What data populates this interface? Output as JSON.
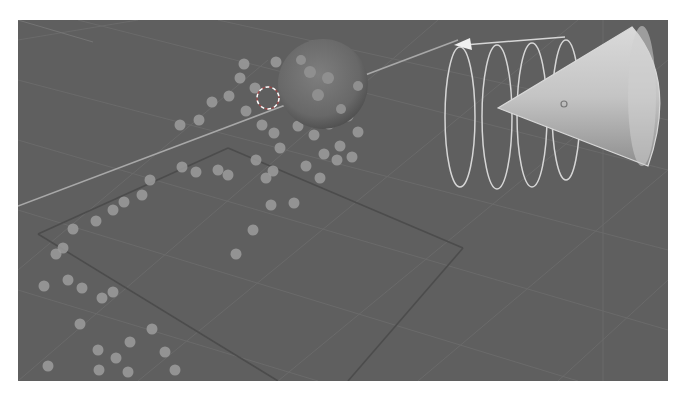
{
  "viewport": {
    "kind": "3d-viewport",
    "background_color": "#5f5f5f",
    "grid_color": "#6c6c6c",
    "axis_line_color": "#a9a9a9",
    "particle_color": "#9c9c9c",
    "objects": [
      {
        "name": "emitter-sphere",
        "type": "uv-sphere",
        "color": "#6a6a6a"
      },
      {
        "name": "cone",
        "type": "cone",
        "color": "#c8c8c8"
      },
      {
        "name": "vortex-spiral",
        "type": "force-field-vortex",
        "color": "#d8d8d8"
      },
      {
        "name": "3d-cursor",
        "type": "cursor"
      },
      {
        "name": "ground-plane",
        "type": "plane-outline",
        "color": "#4e4e4e"
      }
    ],
    "particles": [
      [
        226,
        44
      ],
      [
        295,
        26
      ],
      [
        258,
        42
      ],
      [
        330,
        48
      ],
      [
        305,
        70
      ],
      [
        284,
        62
      ],
      [
        270,
        66
      ],
      [
        222,
        58
      ],
      [
        237,
        68
      ],
      [
        211,
        76
      ],
      [
        194,
        82
      ],
      [
        181,
        100
      ],
      [
        162,
        105
      ],
      [
        228,
        91
      ],
      [
        244,
        105
      ],
      [
        256,
        113
      ],
      [
        278,
        83
      ],
      [
        280,
        106
      ],
      [
        296,
        115
      ],
      [
        311,
        104
      ],
      [
        330,
        96
      ],
      [
        340,
        112
      ],
      [
        322,
        126
      ],
      [
        306,
        134
      ],
      [
        288,
        146
      ],
      [
        302,
        158
      ],
      [
        319,
        140
      ],
      [
        334,
        137
      ],
      [
        262,
        128
      ],
      [
        238,
        140
      ],
      [
        255,
        151
      ],
      [
        210,
        155
      ],
      [
        200,
        150
      ],
      [
        178,
        152
      ],
      [
        164,
        147
      ],
      [
        132,
        160
      ],
      [
        124,
        175
      ],
      [
        106,
        182
      ],
      [
        95,
        190
      ],
      [
        78,
        201
      ],
      [
        55,
        209
      ],
      [
        45,
        228
      ],
      [
        38,
        234
      ],
      [
        50,
        260
      ],
      [
        64,
        268
      ],
      [
        84,
        278
      ],
      [
        95,
        272
      ],
      [
        235,
        210
      ],
      [
        253,
        185
      ],
      [
        276,
        183
      ],
      [
        218,
        234
      ],
      [
        62,
        304
      ],
      [
        80,
        330
      ],
      [
        98,
        338
      ],
      [
        112,
        322
      ],
      [
        134,
        309
      ],
      [
        147,
        332
      ],
      [
        157,
        350
      ],
      [
        110,
        352
      ],
      [
        81,
        350
      ],
      [
        30,
        346
      ],
      [
        26,
        266
      ],
      [
        248,
        158
      ]
    ]
  }
}
